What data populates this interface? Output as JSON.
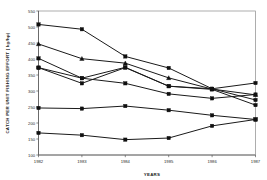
{
  "chart_data": {
    "type": "line",
    "title": "",
    "xlabel": "YEARS",
    "ylabel": "CATCH PER UNIT FISHING EFFORT ( kg/hp)",
    "categories": [
      "1982",
      "1983",
      "1984",
      "1985",
      "1986",
      "1987"
    ],
    "x": [
      1982,
      1983,
      1984,
      1985,
      1986,
      1987
    ],
    "xlim": [
      1982,
      1987
    ],
    "ylim": [
      100,
      550
    ],
    "yticks": [
      100,
      150,
      200,
      250,
      300,
      350,
      400,
      450,
      500,
      550
    ],
    "ytick_labels": [
      "100",
      "150",
      "200",
      "250",
      "300",
      "350",
      "400",
      "450",
      "500",
      "550"
    ],
    "xticks": [
      1982,
      1983,
      1984,
      1985,
      1986,
      1987
    ],
    "xtick_labels": [
      "1982",
      "1983",
      "1984",
      "1985",
      "1986",
      "1987"
    ],
    "grid": false,
    "legend": "none",
    "series": [
      {
        "name": "series-1",
        "marker": "square",
        "values": [
          508,
          493,
          408,
          372,
          307,
          325
        ]
      },
      {
        "name": "series-2",
        "marker": "triangle",
        "values": [
          447,
          401,
          387,
          341,
          306,
          288
        ]
      },
      {
        "name": "series-3",
        "marker": "square",
        "values": [
          402,
          340,
          374,
          315,
          307,
          272
        ]
      },
      {
        "name": "series-4",
        "marker": "square",
        "values": [
          373,
          324,
          373,
          315,
          305,
          256
        ]
      },
      {
        "name": "series-5",
        "marker": "square",
        "values": [
          373,
          340,
          324,
          291,
          277,
          289
        ]
      },
      {
        "name": "series-6",
        "marker": "square",
        "values": [
          247,
          245,
          253,
          240,
          224,
          211
        ]
      },
      {
        "name": "series-7",
        "marker": "square",
        "values": [
          169,
          162,
          148,
          153,
          191,
          211
        ]
      }
    ]
  },
  "axes": {
    "y_title": "CATCH PER UNIT FISHING EFFORT ( kg/hp)",
    "x_title": "YEARS"
  }
}
